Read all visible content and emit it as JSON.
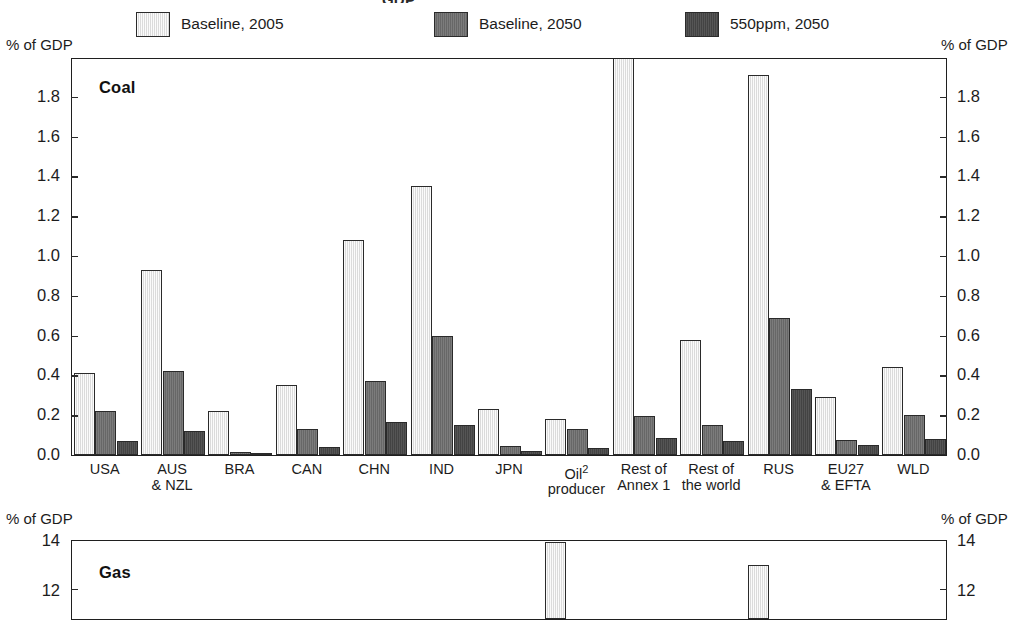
{
  "title_remnant": "GDP",
  "axis_unit_label": "% of GDP",
  "legend": [
    {
      "label": "Baseline, 2005",
      "swatch": "light",
      "color": "#e3e3e3"
    },
    {
      "label": "Baseline, 2050",
      "swatch": "mid",
      "color": "#6d6d6d"
    },
    {
      "label": "550ppm, 2050",
      "swatch": "dark",
      "color": "#484848"
    }
  ],
  "chart_data": [
    {
      "type": "bar",
      "title": "Coal",
      "xlabel": "",
      "ylabel": "% of GDP",
      "ylim": [
        0.0,
        2.0
      ],
      "yticks": [
        "0.0",
        "0.2",
        "0.4",
        "0.6",
        "0.8",
        "1.0",
        "1.2",
        "1.4",
        "1.6",
        "1.8"
      ],
      "grid": false,
      "legend_position": "top",
      "categories": [
        "USA",
        "AUS\n& NZL",
        "BRA",
        "CAN",
        "CHN",
        "IND",
        "JPN",
        "Oil\nproducer",
        "Rest of\nAnnex 1",
        "Rest of\nthe world",
        "RUS",
        "EU27\n& EFTA",
        "WLD"
      ],
      "category_footnote": {
        "category": "Oil\nproducer",
        "marker": "2"
      },
      "series": [
        {
          "name": "Baseline, 2005",
          "values": [
            0.41,
            0.93,
            0.22,
            0.35,
            1.08,
            1.35,
            0.23,
            0.18,
            2.45,
            0.58,
            1.91,
            0.29,
            0.44
          ]
        },
        {
          "name": "Baseline, 2050",
          "values": [
            0.22,
            0.42,
            0.015,
            0.13,
            0.37,
            0.6,
            0.045,
            0.13,
            0.195,
            0.15,
            0.69,
            0.075,
            0.2
          ]
        },
        {
          "name": "550ppm, 2050",
          "values": [
            0.07,
            0.12,
            0.01,
            0.04,
            0.165,
            0.15,
            0.02,
            0.035,
            0.085,
            0.07,
            0.33,
            0.05,
            0.08
          ]
        }
      ],
      "clipped_series_note": "Rest of Annex 1, Baseline 2005 bar exceeds axis maximum"
    },
    {
      "type": "bar",
      "title": "Gas",
      "xlabel": "",
      "ylabel": "% of GDP",
      "ylim": [
        0,
        14
      ],
      "yticks": [
        "12",
        "14"
      ],
      "grid": false,
      "categories": [
        "USA",
        "AUS\n& NZL",
        "BRA",
        "CAN",
        "CHN",
        "IND",
        "JPN",
        "Oil\nproducer",
        "Rest of\nAnnex 1",
        "Rest of\nthe world",
        "RUS",
        "EU27\n& EFTA",
        "WLD"
      ],
      "series": [
        {
          "name": "Baseline, 2005",
          "values": [
            null,
            null,
            null,
            null,
            null,
            null,
            null,
            13.8,
            null,
            null,
            12.9,
            null,
            null
          ]
        }
      ],
      "note": "panel cropped at bottom of screenshot"
    }
  ]
}
